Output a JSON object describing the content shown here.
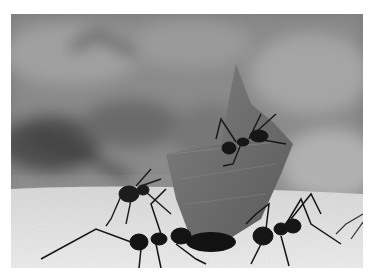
{
  "image": {
    "subject": "leaf-cutter ants carrying a leaf fragment",
    "style": "grayscale photograph",
    "colors": {
      "background_blur": "#858585",
      "ground": "#e4e4e4",
      "leaf": "#6e6e6e",
      "ant": "#1a1a1a",
      "border": "#ffffff"
    }
  }
}
